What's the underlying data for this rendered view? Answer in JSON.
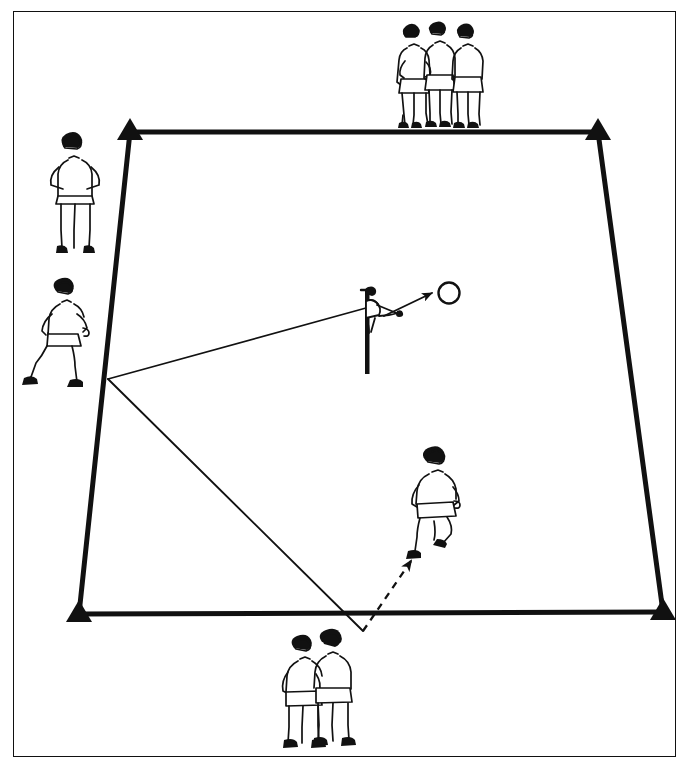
{
  "page": {
    "top_caption": "",
    "background_color": "#ffffff",
    "ink_color": "#111111",
    "width": 691,
    "height": 768
  },
  "frame": {
    "name": "outer-border",
    "left": 13,
    "top": 11,
    "width": 663,
    "height": 746,
    "stroke_color": "#111111",
    "stroke_width": 1.6
  },
  "field": {
    "shape": "trapezoid-grid",
    "stroke_color": "#111111",
    "boundary_stroke_width": 5,
    "corners": [
      {
        "name": "cone-top-left",
        "label": "Cone A",
        "x": 130,
        "y": 132
      },
      {
        "name": "cone-top-right",
        "label": "Cone B",
        "x": 598,
        "y": 132
      },
      {
        "name": "cone-bottom-right",
        "label": "Cone C",
        "x": 663,
        "y": 612
      },
      {
        "name": "cone-bottom-left",
        "label": "Cone D",
        "x": 79,
        "y": 614
      }
    ],
    "cone_marker": {
      "shape": "filled-triangle",
      "half_width": 13,
      "height": 21,
      "fill": "#111111"
    },
    "boundary_edges": [
      {
        "name": "edge-top",
        "from": [
          130,
          132
        ],
        "to": [
          598,
          132
        ]
      },
      {
        "name": "edge-right",
        "from": [
          598,
          132
        ],
        "to": [
          663,
          612
        ]
      },
      {
        "name": "edge-bottom",
        "from": [
          663,
          612
        ],
        "to": [
          79,
          614
        ]
      },
      {
        "name": "edge-left",
        "from": [
          79,
          614
        ],
        "to": [
          130,
          132
        ]
      }
    ]
  },
  "movement": {
    "junction_point": {
      "name": "run-junction",
      "x": 108,
      "y": 379
    },
    "paths": [
      {
        "name": "pass-path-to-server",
        "style": "solid",
        "stroke_width": 1.6,
        "from": [
          108,
          379
        ],
        "to": [
          366,
          308
        ],
        "arrow": false
      },
      {
        "name": "run-path-to-bottom",
        "style": "solid",
        "stroke_width": 1.8,
        "from": [
          108,
          379
        ],
        "to": [
          363,
          631
        ],
        "arrow": false
      },
      {
        "name": "ball-flight-path",
        "style": "solid-arrow",
        "stroke_width": 1.8,
        "from": [
          385,
          315
        ],
        "to": [
          434,
          293
        ],
        "arrow": true,
        "arrow_target": "ball"
      },
      {
        "name": "dashed-run-path",
        "style": "dashed-arrow",
        "stroke_width": 2.2,
        "dash_pattern": "7 6",
        "from": [
          363,
          631
        ],
        "to": [
          410,
          560
        ],
        "arrow": true
      }
    ],
    "ball": {
      "name": "ball",
      "shape": "circle-outline",
      "cx": 449,
      "cy": 293,
      "r": 11,
      "stroke_width": 2.4
    }
  },
  "figures": [
    {
      "name": "player-group-top",
      "label": "Three players waiting",
      "pose": "standing-group-of-three",
      "count": 3,
      "x": 383,
      "y": 17,
      "w": 105,
      "h": 105
    },
    {
      "name": "player-coach-left",
      "label": "Coach, hands on hips",
      "pose": "standing-hands-on-hips",
      "count": 1,
      "x": 44,
      "y": 133,
      "w": 62,
      "h": 120
    },
    {
      "name": "player-walking-left",
      "label": "Player moving right",
      "pose": "walking-right",
      "count": 1,
      "x": 22,
      "y": 276,
      "w": 82,
      "h": 112
    },
    {
      "name": "player-server-center",
      "label": "Server on post",
      "pose": "throwing-on-post",
      "count": 1,
      "x": 355,
      "y": 284,
      "w": 50,
      "h": 90
    },
    {
      "name": "player-runner-center",
      "label": "Player running to receive",
      "pose": "running-forward",
      "count": 1,
      "x": 400,
      "y": 447,
      "w": 62,
      "h": 110
    },
    {
      "name": "player-pair-bottom",
      "label": "Two players queueing",
      "pose": "standing-pair",
      "count": 2,
      "x": 272,
      "y": 630,
      "w": 82,
      "h": 118
    }
  ],
  "legend": {
    "solid_line_meaning": "Pass / ball path",
    "dashed_line_meaning": "Player run",
    "triangle_meaning": "Cone marker"
  }
}
